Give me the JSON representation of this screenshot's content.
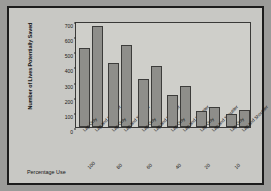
{
  "chart_data": {
    "type": "bar",
    "title": "",
    "xlabel": "Percentage Use",
    "ylabel": "Number of Lives Potentially Saved",
    "ylim": [
      0,
      700
    ],
    "yticks": [
      0,
      100,
      200,
      300,
      400,
      500,
      600,
      700
    ],
    "grid": false,
    "legend": "none",
    "categories": [
      "100",
      "80",
      "60",
      "40",
      "20",
      "10"
    ],
    "series": [
      {
        "name": "Lap Only",
        "values": [
          525,
          420,
          320,
          210,
          108,
          88
        ]
      },
      {
        "name": "Lap and Shoulder",
        "values": [
          670,
          540,
          405,
          270,
          135,
          110
        ]
      }
    ],
    "bar_labels": [
      "Lap Only",
      "Lap and Shoulder"
    ],
    "colors": {
      "bar_fill": "#8e8e8a",
      "bar_edge": "#3c3c3a",
      "figure_bg": "#c8c8c4",
      "plot_bg": "#cfcfca",
      "frame": "#1c1c1c",
      "text": "#141414"
    }
  }
}
